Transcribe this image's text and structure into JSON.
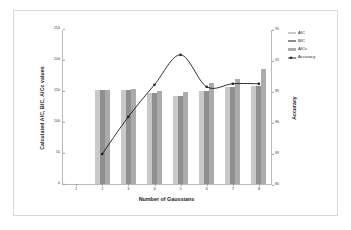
{
  "chart_data": {
    "type": "bar",
    "title": "",
    "xlabel": "Number of Gaussians",
    "ylabel": "Calculated AIC, BIC, AICc values",
    "y2label": "Accuracy",
    "categories": [
      "1",
      "2",
      "3",
      "4",
      "5",
      "6",
      "7",
      "8"
    ],
    "ylim": [
      0,
      250
    ],
    "yticks": [
      "0",
      "50",
      "100",
      "150",
      "200",
      "250"
    ],
    "y2lim": [
      80,
      95
    ],
    "y2ticks": [
      "80",
      "83",
      "86",
      "89",
      "92",
      "95"
    ],
    "grid": false,
    "legend_position": "right",
    "series": [
      {
        "name": "AIC",
        "type": "bar",
        "color": "#c9c9c9",
        "values": [
          null,
          152,
          152,
          146,
          142,
          150,
          157,
          158
        ]
      },
      {
        "name": "BIC",
        "type": "bar",
        "color": "#8f8f8f",
        "values": [
          null,
          152,
          152,
          146,
          142,
          150,
          157,
          158
        ]
      },
      {
        "name": "AICc",
        "type": "bar",
        "color": "#ababab",
        "values": [
          null,
          152,
          153,
          150,
          149,
          163,
          170,
          185
        ]
      },
      {
        "name": "Accuracy",
        "type": "line",
        "color": "#1a1a1a",
        "values": [
          null,
          83.0,
          86.6,
          89.7,
          92.6,
          89.5,
          89.8,
          89.8
        ]
      }
    ]
  },
  "legend": {
    "items": [
      {
        "label": "AIC"
      },
      {
        "label": "BIC"
      },
      {
        "label": "AICc"
      },
      {
        "label": "Accuracy"
      }
    ]
  }
}
